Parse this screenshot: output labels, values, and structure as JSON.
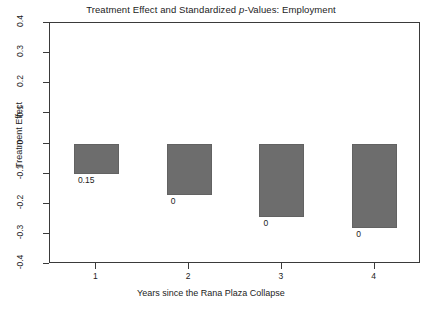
{
  "chart_data": {
    "type": "bar",
    "title": "Treatment Effect and Standardized p-Values: Employment",
    "title_prefix": "Treatment Effect and Standardized ",
    "title_italic": "p",
    "title_suffix": "-Values: Employment",
    "xlabel": "Years since the Rana Plaza Collapse",
    "ylabel": "Treatment Effect",
    "categories": [
      "1",
      "2",
      "3",
      "4"
    ],
    "values": [
      -0.1,
      -0.17,
      -0.245,
      -0.28
    ],
    "point_labels": [
      "0.15",
      "0",
      "0",
      "0"
    ],
    "point_label_meaning": "standardized p-value",
    "ylim": [
      -0.4,
      0.4
    ],
    "yticks": [
      "0.4",
      "0.3",
      "0.2",
      "0.1",
      "0",
      "-0.1",
      "-0.2",
      "-0.3",
      "-0.4"
    ],
    "ytick_values": [
      0.4,
      0.3,
      0.2,
      0.1,
      0,
      -0.1,
      -0.2,
      -0.3,
      -0.4
    ],
    "xticks": [
      "1",
      "2",
      "3",
      "4"
    ],
    "grid": false,
    "legend": false,
    "bar_color": "#6d6d6d",
    "bar_border_color": "#626262",
    "axis_color": "#3a3a3a",
    "background": "#ffffff"
  },
  "caption_sliver": ""
}
